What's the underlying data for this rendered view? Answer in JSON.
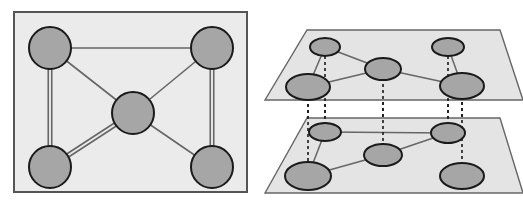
{
  "figure": {
    "type": "diagram",
    "width": 523,
    "height": 208,
    "background": "#ffffff"
  },
  "colors": {
    "panel_fill": "#ebebeb",
    "panel_stroke": "#555555",
    "plane_fill": "#e4e4e4",
    "plane_stroke": "#666666",
    "node_fill": "#a6a6a6",
    "node_stroke": "#1a1a1a",
    "edge_stroke": "#666666",
    "dashed_stroke": "#1a1a1a",
    "page_background": "#ffffff"
  },
  "left_panel": {
    "name": "flattened-multigraph-panel",
    "frame": {
      "x": 14,
      "y": 12,
      "width": 233,
      "height": 180
    },
    "node_radius": 21,
    "nodes": [
      {
        "id": "tl",
        "label": "",
        "cx": 50,
        "cy": 48
      },
      {
        "id": "tr",
        "label": "",
        "cx": 212,
        "cy": 48
      },
      {
        "id": "c",
        "label": "",
        "cx": 133,
        "cy": 113
      },
      {
        "id": "bl",
        "label": "",
        "cx": 50,
        "cy": 167
      },
      {
        "id": "br",
        "label": "",
        "cx": 212,
        "cy": 167
      }
    ],
    "edges": [
      {
        "from": "tl",
        "to": "tr",
        "multiplicity": 1
      },
      {
        "from": "tl",
        "to": "bl",
        "multiplicity": 2
      },
      {
        "from": "tr",
        "to": "br",
        "multiplicity": 2
      },
      {
        "from": "tl",
        "to": "c",
        "multiplicity": 1
      },
      {
        "from": "tr",
        "to": "c",
        "multiplicity": 1
      },
      {
        "from": "c",
        "to": "bl",
        "multiplicity": 2
      },
      {
        "from": "c",
        "to": "br",
        "multiplicity": 1
      }
    ]
  },
  "right_panel": {
    "name": "multiplex-layer-panel",
    "upper_plane": {
      "name": "upper-layer-plane",
      "polygon": "307,30 500,30 523,100 265,100",
      "node_rx": 17,
      "node_ry": 10,
      "nodes": [
        {
          "id": "u1",
          "label": "",
          "cx": 325,
          "cy": 47,
          "rx": 15,
          "ry": 9
        },
        {
          "id": "u2",
          "label": "",
          "cx": 383,
          "cy": 69,
          "rx": 18,
          "ry": 11
        },
        {
          "id": "u3",
          "label": "",
          "cx": 448,
          "cy": 47,
          "rx": 16,
          "ry": 9
        },
        {
          "id": "u4",
          "label": "",
          "cx": 308,
          "cy": 87,
          "rx": 22,
          "ry": 13
        },
        {
          "id": "u5",
          "label": "",
          "cx": 462,
          "cy": 86,
          "rx": 22,
          "ry": 13
        }
      ],
      "edges": [
        {
          "from": "u1",
          "to": "u4"
        },
        {
          "from": "u1",
          "to": "u2"
        },
        {
          "from": "u2",
          "to": "u4"
        },
        {
          "from": "u2",
          "to": "u5"
        },
        {
          "from": "u3",
          "to": "u5"
        }
      ]
    },
    "lower_plane": {
      "name": "lower-layer-plane",
      "polygon": "307,118 500,118 523,193 265,193",
      "nodes": [
        {
          "id": "l1",
          "label": "",
          "cx": 325,
          "cy": 132,
          "rx": 16,
          "ry": 9
        },
        {
          "id": "l2",
          "label": "",
          "cx": 383,
          "cy": 155,
          "rx": 19,
          "ry": 11
        },
        {
          "id": "l3",
          "label": "",
          "cx": 448,
          "cy": 133,
          "rx": 17,
          "ry": 10
        },
        {
          "id": "l4",
          "label": "",
          "cx": 308,
          "cy": 176,
          "rx": 23,
          "ry": 14
        },
        {
          "id": "l5",
          "label": "",
          "cx": 462,
          "cy": 176,
          "rx": 22,
          "ry": 13
        }
      ],
      "edges": [
        {
          "from": "l1",
          "to": "l3"
        },
        {
          "from": "l1",
          "to": "l4"
        },
        {
          "from": "l4",
          "to": "l2"
        },
        {
          "from": "l2",
          "to": "l3"
        }
      ]
    },
    "interlayer_links": [
      {
        "from": "u4",
        "to": "l4",
        "x": 308,
        "y1": 92,
        "y2": 176
      },
      {
        "from": "u1",
        "to": "l1",
        "x": 325,
        "y1": 50,
        "y2": 132
      },
      {
        "from": "u2",
        "to": "l2",
        "x": 383,
        "y1": 72,
        "y2": 155
      },
      {
        "from": "u3",
        "to": "l3",
        "x": 448,
        "y1": 50,
        "y2": 133
      },
      {
        "from": "u5",
        "to": "l5",
        "x": 462,
        "y1": 90,
        "y2": 176
      }
    ]
  }
}
